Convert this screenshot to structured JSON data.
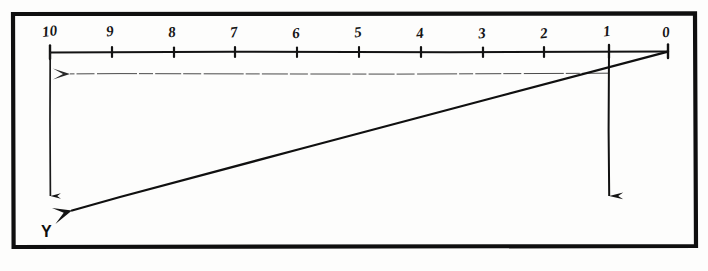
{
  "figure": {
    "background_color": "#fdfdfc",
    "ink_color": "#141414",
    "border": {
      "name": "figure-frame",
      "x": 11,
      "y": 12,
      "width": 686,
      "height": 236,
      "stroke_width": 4
    }
  },
  "axis": {
    "name": "horizontal-scale-axis",
    "y": 52,
    "x_start": 50,
    "x_end": 668,
    "tick_spacing": 61.8,
    "tick_height": 7,
    "direction": "right-to-left descending"
  },
  "tick_labels": [
    {
      "text": "10",
      "value": 10,
      "x": 50
    },
    {
      "text": "9",
      "value": 9,
      "x": 112
    },
    {
      "text": "8",
      "value": 8,
      "x": 174
    },
    {
      "text": "7",
      "value": 7,
      "x": 235
    },
    {
      "text": "6",
      "value": 6,
      "x": 297
    },
    {
      "text": "5",
      "value": 5,
      "x": 359
    },
    {
      "text": "4",
      "value": 4,
      "x": 421
    },
    {
      "text": "3",
      "value": 3,
      "x": 483
    },
    {
      "text": "2",
      "value": 2,
      "x": 544
    },
    {
      "text": "1",
      "value": 1,
      "x": 606
    },
    {
      "text": "0",
      "value": 0,
      "x": 668
    }
  ],
  "lines": {
    "left_vertical": {
      "name": "left-vertical-drop-line",
      "x": 50,
      "y_start": 52,
      "y_end": 215,
      "arrow": "down",
      "stroke_width": 1.6
    },
    "right_vertical": {
      "name": "right-vertical-drop-line",
      "x": 609,
      "y_start": 52,
      "y_end": 215,
      "arrow": "down",
      "stroke_width": 1.9
    },
    "horizontal_projector": {
      "name": "horizontal-projection-line",
      "x_start": 609,
      "x_end": 52,
      "y": 74,
      "arrow": "left",
      "stroke_width": 0.9,
      "style": "faint"
    },
    "diagonal": {
      "name": "diagonal-construction-line",
      "x_start": 668,
      "y_start": 51,
      "x_end": 51,
      "y_end": 215,
      "arrow": "down-left",
      "stroke_width": 2.2
    }
  },
  "point_labels": [
    {
      "text": "Y",
      "name": "point-label-y",
      "x": 41,
      "y": 224
    }
  ]
}
